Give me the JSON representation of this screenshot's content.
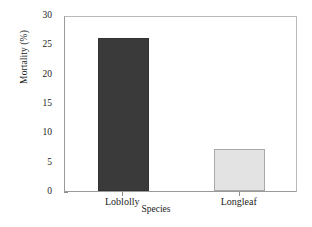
{
  "chart_data": {
    "type": "bar",
    "title": "",
    "xlabel": "Species",
    "ylabel": "Mortality (%)",
    "categories": [
      "Loblolly",
      "Longleaf"
    ],
    "values": [
      26.1,
      7.1
    ],
    "yticks": [
      "0",
      "5",
      "10",
      "15",
      "20",
      "25",
      "30"
    ],
    "ylim": [
      0,
      30
    ],
    "grid": false,
    "legend": false,
    "bar_colors": [
      "#3a3a3a",
      "#e3e3e3"
    ],
    "bar_edge_colors": [
      "#333333",
      "#a8a8a8"
    ],
    "background": "#ffffff",
    "frame_color": "#9a9a9a"
  }
}
